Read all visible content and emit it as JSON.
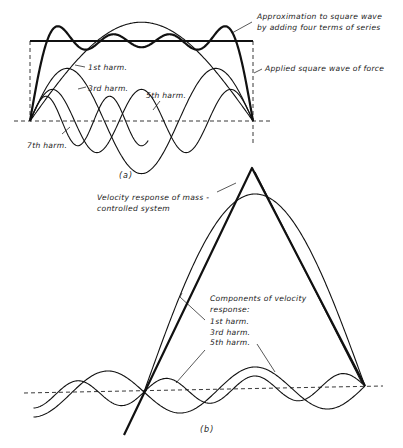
{
  "figure": {
    "part_a": {
      "caption": "(a)",
      "labels": {
        "approximation_line1": "Approximation to square wave",
        "approximation_line2": "by adding four terms of series",
        "square_wave": "Applied square wave of force",
        "first_harm": "1st harm.",
        "third_harm": "3rd harm.",
        "fifth_harm": "5th harm.",
        "seventh_harm": "7th harm."
      }
    },
    "part_b": {
      "caption": "(b)",
      "labels": {
        "velocity_line1": "Velocity response of mass -",
        "velocity_line2": "controlled system",
        "components_line1": "Components of velocity",
        "components_line2": "response:",
        "first_harm": "1st harm.",
        "third_harm": "3rd harm.",
        "fifth_harm": "5th harm."
      }
    }
  },
  "colors": {
    "ink": "#111111",
    "background": "#ffffff"
  }
}
